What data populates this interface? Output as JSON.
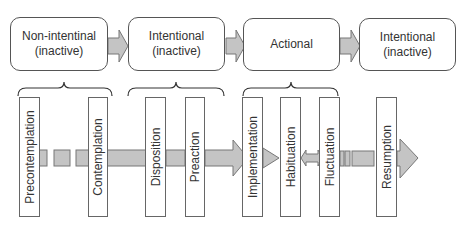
{
  "stages": [
    {
      "line1": "Non-intentinal",
      "line2": "(inactive)"
    },
    {
      "line1": "Intentional",
      "line2": "(inactive)"
    },
    {
      "line1": "Actional",
      "line2": ""
    },
    {
      "line1": "Intentional",
      "line2": "(inactive)"
    }
  ],
  "phases": [
    "Precontemplation",
    "Contemplation",
    "Disposition",
    "Preaction",
    "Implementation",
    "Habituation",
    "Fluctuation",
    "Resumption"
  ],
  "colors": {
    "arrow_fill": "#c4c4c4",
    "arrow_stroke": "#777777",
    "box_stroke": "#555555"
  }
}
